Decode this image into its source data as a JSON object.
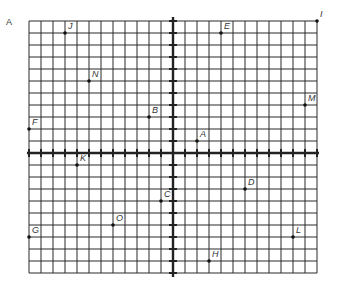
{
  "diagram": {
    "corner_label": "A",
    "grid": {
      "origin_px": [
        173,
        153
      ],
      "cell_px": 12,
      "x_min": -12,
      "x_max": 12,
      "y_min": -10,
      "y_max": 11,
      "line_color": "#2a2a2a",
      "axis_color": "#222222"
    },
    "points": [
      {
        "label": "J",
        "x": -9,
        "y": 10
      },
      {
        "label": "N",
        "x": -7,
        "y": 6
      },
      {
        "label": "E",
        "x": 4,
        "y": 10
      },
      {
        "label": "I",
        "x": 12,
        "y": 11
      },
      {
        "label": "M",
        "x": 11,
        "y": 4
      },
      {
        "label": "F",
        "x": -12,
        "y": 2
      },
      {
        "label": "B",
        "x": -2,
        "y": 3
      },
      {
        "label": "A",
        "x": 2,
        "y": 1
      },
      {
        "label": "K",
        "x": -8,
        "y": -1
      },
      {
        "label": "D",
        "x": 6,
        "y": -3
      },
      {
        "label": "C",
        "x": -1,
        "y": -4
      },
      {
        "label": "O",
        "x": -5,
        "y": -6
      },
      {
        "label": "G",
        "x": -12,
        "y": -7
      },
      {
        "label": "L",
        "x": 10,
        "y": -7
      },
      {
        "label": "H",
        "x": 3,
        "y": -9
      }
    ]
  }
}
